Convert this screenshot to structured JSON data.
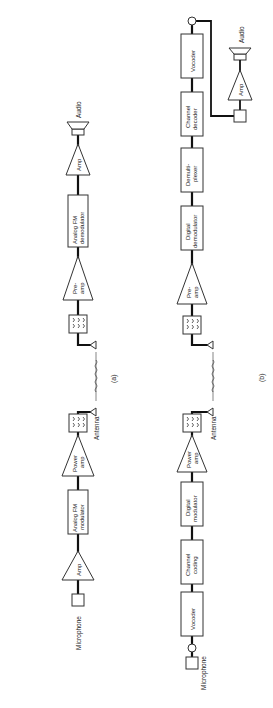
{
  "diagram": {
    "a": {
      "caption": "(a)",
      "blocks": {
        "audio": "Audio",
        "rx_amp": "Amp",
        "fm_demod": [
          "Analog FM",
          "demodulator"
        ],
        "preamp": [
          "Pre-",
          "amp"
        ],
        "antenna": "Antenna",
        "power_amp": [
          "Power",
          "amp"
        ],
        "fm_mod": [
          "Analog FM",
          "modulator"
        ],
        "tx_amp": "Amp",
        "microphone": "Microphone"
      }
    },
    "b": {
      "caption": "(b)",
      "blocks": {
        "vocoder_rx": "Vocoder",
        "channel_decoder": [
          "Channel",
          "decoder"
        ],
        "demux": [
          "Demulti-",
          "plexer"
        ],
        "digital_demod": [
          "Digital",
          "demodulator"
        ],
        "preamp": [
          "Pre-",
          "amp"
        ],
        "audio": "Audio",
        "rx_amp": "Amp",
        "antenna": "Antenna",
        "power_amp": [
          "Power",
          "amp"
        ],
        "digital_mod": [
          "Digital",
          "modulator"
        ],
        "channel_coding": [
          "Channel",
          "coding"
        ],
        "vocoder_tx": "Vocoder",
        "microphone": "Microphone"
      }
    }
  }
}
